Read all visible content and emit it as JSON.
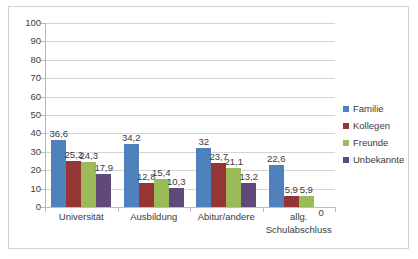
{
  "chart_data": {
    "type": "bar",
    "title": "",
    "subtitle": "",
    "xlabel": "",
    "ylabel": "",
    "ylim": [
      0,
      100
    ],
    "ytick_step": 10,
    "yticks": [
      "100",
      "90",
      "80",
      "70",
      "60",
      "50",
      "40",
      "30",
      "20",
      "10",
      "0"
    ],
    "grid": true,
    "legend_position": "right",
    "decimal_separator": ",",
    "categories": [
      "Universität",
      "Ausbildung",
      "Abitur/andere",
      "allg. Schulabschluss"
    ],
    "category_lines": [
      [
        "Universität"
      ],
      [
        "Ausbildung"
      ],
      [
        "Abitur/andere"
      ],
      [
        "allg.",
        "Schulabschluss"
      ]
    ],
    "series": [
      {
        "name": "Familie",
        "color": "#4f81bd",
        "values": [
          36.6,
          34.2,
          32,
          22.6
        ],
        "labels": [
          "36,6",
          "34,2",
          "32",
          "22,6"
        ]
      },
      {
        "name": "Kollegen",
        "color": "#963634",
        "values": [
          25.2,
          12.8,
          23.7,
          5.9
        ],
        "labels": [
          "25,2",
          "12,8",
          "23,7",
          "5,9"
        ]
      },
      {
        "name": "Freunde",
        "color": "#9bbb59",
        "values": [
          24.3,
          15.4,
          21.1,
          5.9
        ],
        "labels": [
          "24,3",
          "15,4",
          "21,1",
          "5,9"
        ]
      },
      {
        "name": "Unbekannte",
        "color": "#604a7b",
        "values": [
          17.9,
          10.3,
          13.2,
          0
        ],
        "labels": [
          "17,9",
          "10,3",
          "13,2",
          "0"
        ]
      }
    ]
  },
  "legend": {
    "items": [
      {
        "label": "Familie",
        "color": "#4f81bd"
      },
      {
        "label": "Kollegen",
        "color": "#963634"
      },
      {
        "label": "Freunde",
        "color": "#9bbb59"
      },
      {
        "label": "Unbekannte",
        "color": "#604a7b"
      }
    ]
  }
}
